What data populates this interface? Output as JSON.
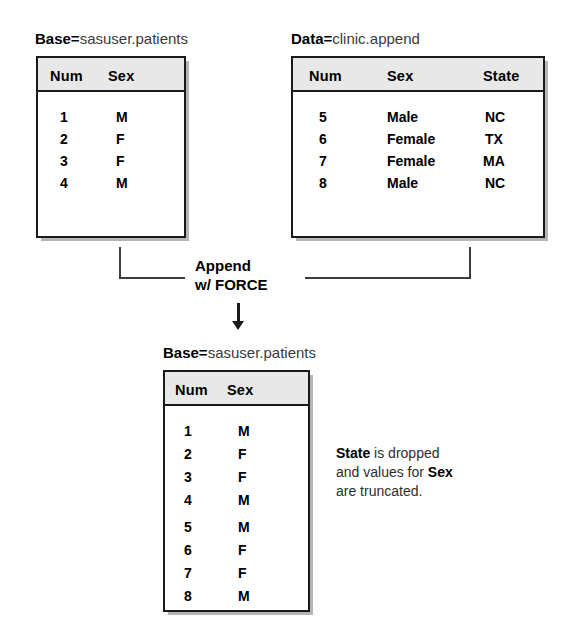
{
  "diagram": {
    "title_prefix_base": "Base",
    "title_prefix_data": "Data",
    "equals": "=",
    "base_dataset": "sasuser.patients",
    "data_dataset": "clinic.append",
    "operation_line1": "Append",
    "operation_line2": "w/ FORCE",
    "annotation": {
      "bold1": "State",
      "text1": " is dropped",
      "text2": "and values for ",
      "bold2": "Sex",
      "text3": "are truncated."
    },
    "colors": {
      "header_fill": "#e8e8e8",
      "border": "#1a1a1a",
      "text": "#000000",
      "connector": "#3d3d3d"
    }
  },
  "base_table": {
    "columns": [
      "Num",
      "Sex"
    ],
    "rows": [
      [
        "1",
        "M"
      ],
      [
        "2",
        "F"
      ],
      [
        "3",
        "F"
      ],
      [
        "4",
        "M"
      ]
    ]
  },
  "data_table": {
    "columns": [
      "Num",
      "Sex",
      "State"
    ],
    "rows": [
      [
        "5",
        "Male",
        "NC"
      ],
      [
        "6",
        "Female",
        "TX"
      ],
      [
        "7",
        "Female",
        "MA"
      ],
      [
        "8",
        "Male",
        "NC"
      ]
    ]
  },
  "result_table": {
    "columns": [
      "Num",
      "Sex"
    ],
    "rows": [
      [
        "1",
        "M"
      ],
      [
        "2",
        "F"
      ],
      [
        "3",
        "F"
      ],
      [
        "4",
        "M"
      ],
      [
        "5",
        "M"
      ],
      [
        "6",
        "F"
      ],
      [
        "7",
        "F"
      ],
      [
        "8",
        "M"
      ]
    ]
  }
}
